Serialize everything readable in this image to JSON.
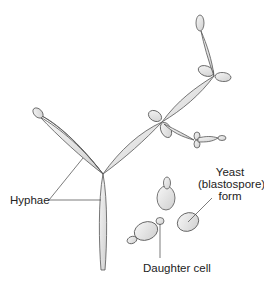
{
  "diagram": {
    "labels": {
      "hyphae": "Hyphae",
      "yeast_line1": "Yeast",
      "yeast_line2": "(blastospore)",
      "yeast_line3": "form",
      "daughter_cell": "Daughter cell"
    },
    "colors": {
      "fill": "#e4e4e4",
      "stroke": "#555555",
      "leader_line": "#444444",
      "text": "#222222"
    }
  }
}
